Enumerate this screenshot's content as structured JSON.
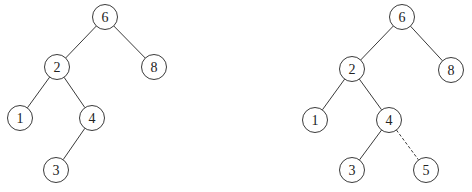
{
  "figure": {
    "type": "binary-search-tree-insertion",
    "trees": [
      {
        "id": "before",
        "nodes": [
          {
            "id": "n6",
            "label": "6",
            "x": 105,
            "y": 17
          },
          {
            "id": "n2",
            "label": "2",
            "x": 57,
            "y": 67
          },
          {
            "id": "n8",
            "label": "8",
            "x": 154,
            "y": 67
          },
          {
            "id": "n1",
            "label": "1",
            "x": 20,
            "y": 118
          },
          {
            "id": "n4",
            "label": "4",
            "x": 92,
            "y": 118
          },
          {
            "id": "n3",
            "label": "3",
            "x": 56,
            "y": 170
          }
        ],
        "edges": [
          {
            "from": "n6",
            "to": "n2",
            "style": "solid"
          },
          {
            "from": "n6",
            "to": "n8",
            "style": "solid"
          },
          {
            "from": "n2",
            "to": "n1",
            "style": "solid"
          },
          {
            "from": "n2",
            "to": "n4",
            "style": "solid"
          },
          {
            "from": "n4",
            "to": "n3",
            "style": "solid"
          }
        ]
      },
      {
        "id": "after",
        "nodes": [
          {
            "id": "m6",
            "label": "6",
            "x": 402,
            "y": 17
          },
          {
            "id": "m2",
            "label": "2",
            "x": 352,
            "y": 69
          },
          {
            "id": "m8",
            "label": "8",
            "x": 451,
            "y": 70
          },
          {
            "id": "m1",
            "label": "1",
            "x": 315,
            "y": 120
          },
          {
            "id": "m4",
            "label": "4",
            "x": 389,
            "y": 120
          },
          {
            "id": "m3",
            "label": "3",
            "x": 352,
            "y": 170
          },
          {
            "id": "m5",
            "label": "5",
            "x": 426,
            "y": 170
          }
        ],
        "edges": [
          {
            "from": "m6",
            "to": "m2",
            "style": "solid"
          },
          {
            "from": "m6",
            "to": "m8",
            "style": "solid"
          },
          {
            "from": "m2",
            "to": "m1",
            "style": "solid"
          },
          {
            "from": "m2",
            "to": "m4",
            "style": "solid"
          },
          {
            "from": "m4",
            "to": "m3",
            "style": "solid"
          },
          {
            "from": "m4",
            "to": "m5",
            "style": "dashed"
          }
        ]
      }
    ],
    "node_radius": 12.5,
    "colors": {
      "stroke": "#3a3a3a",
      "text": "#222222",
      "background": "#ffffff"
    }
  }
}
